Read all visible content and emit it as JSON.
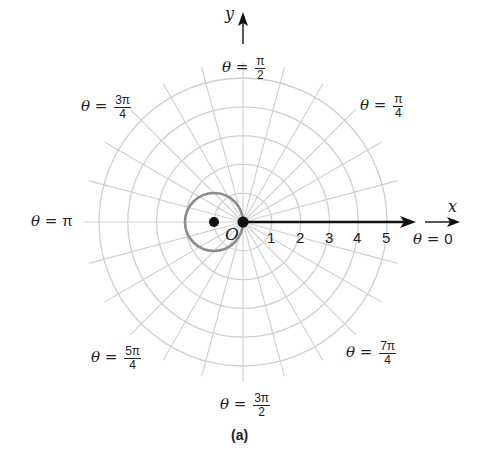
{
  "figure": {
    "caption": "(a)",
    "origin_label": "O",
    "x_axis_label": "x",
    "y_axis_label": "y",
    "ring_tick_labels": [
      "1",
      "2",
      "3",
      "4",
      "5"
    ],
    "angle_labels": {
      "theta_0": {
        "prefix": "θ = ",
        "value": "0"
      },
      "theta_pi_4": {
        "prefix": "θ = ",
        "num": "π",
        "den": "4"
      },
      "theta_pi_2": {
        "prefix": "θ = ",
        "num": "π",
        "den": "2"
      },
      "theta_3pi_4": {
        "prefix": "θ = ",
        "num": "3π",
        "den": "4"
      },
      "theta_pi": {
        "prefix": "θ = ",
        "value": "π"
      },
      "theta_5pi_4": {
        "prefix": "θ = ",
        "num": "5π",
        "den": "4"
      },
      "theta_3pi_2": {
        "prefix": "θ = ",
        "num": "3π",
        "den": "2"
      },
      "theta_7pi_4": {
        "prefix": "θ = ",
        "num": "7π",
        "den": "4"
      }
    },
    "grid": {
      "rings": 5,
      "spoke_step": "π/12",
      "grid_color": "#cfcfcf",
      "curve_color": "#8c8c8c",
      "axis_color": "#111111"
    },
    "curve": {
      "type": "circle",
      "description": "circle of radius 1/2 centered at (-1/2, 0), passing through the pole",
      "center_point_marked": true
    }
  }
}
